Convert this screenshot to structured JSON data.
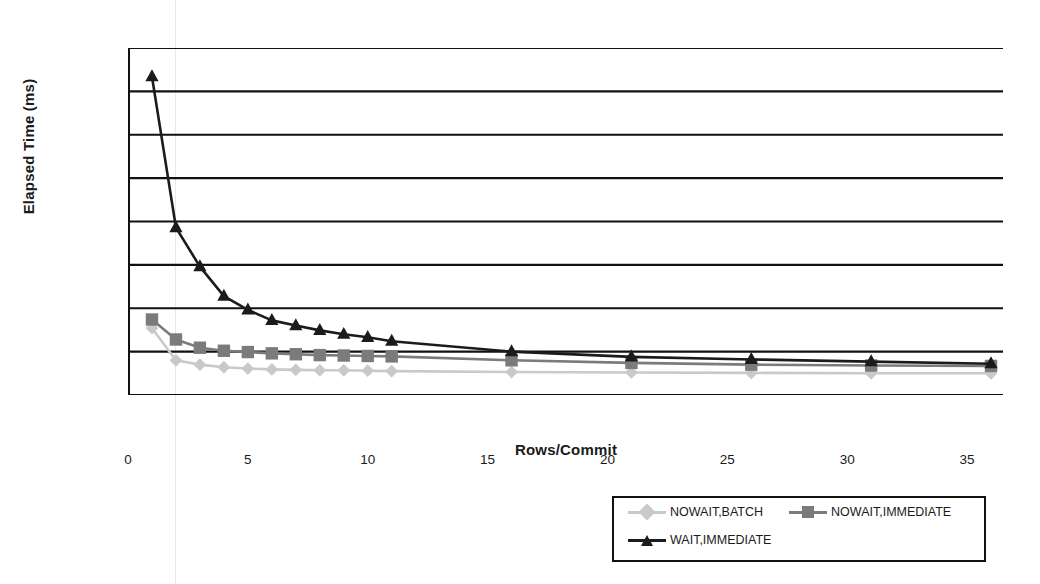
{
  "chart_data": {
    "type": "line",
    "title": "",
    "xlabel": "Rows/Commit",
    "ylabel": "Elapsed Time (ms)",
    "xlim": [
      0,
      36.5
    ],
    "ylim": [
      0,
      4000
    ],
    "grid": true,
    "legend_position": "bottom-right",
    "x_ticks": [
      "0",
      "5",
      "10",
      "15",
      "20",
      "25",
      "30",
      "35"
    ],
    "x_tick_values": [
      0,
      5,
      10,
      15,
      20,
      25,
      30,
      35
    ],
    "y_ticks": [
      "0",
      "500",
      "1,000",
      "1,500",
      "2,000",
      "2,500",
      "3,000",
      "3,500",
      "4,000"
    ],
    "y_tick_values": [
      0,
      500,
      1000,
      1500,
      2000,
      2500,
      3000,
      3500,
      4000
    ],
    "x": [
      1,
      2,
      3,
      4,
      5,
      6,
      7,
      8,
      9,
      10,
      11,
      16,
      21,
      26,
      31,
      36
    ],
    "series": [
      {
        "name": "NOWAIT,BATCH",
        "marker": "diamond",
        "color": "#c9c9c9",
        "values": [
          770,
          400,
          350,
          320,
          305,
          295,
          290,
          285,
          285,
          280,
          275,
          265,
          260,
          255,
          250,
          250
        ]
      },
      {
        "name": "NOWAIT,IMMEDIATE",
        "marker": "square",
        "color": "#7b7b7b",
        "values": [
          870,
          640,
          545,
          510,
          495,
          480,
          470,
          460,
          455,
          450,
          445,
          400,
          370,
          350,
          340,
          335
        ]
      },
      {
        "name": "WAIT,IMMEDIATE",
        "marker": "triangle",
        "color": "#1b1b1b",
        "values": [
          3670,
          1930,
          1480,
          1140,
          980,
          860,
          800,
          745,
          700,
          665,
          620,
          500,
          440,
          410,
          385,
          360
        ]
      }
    ]
  }
}
